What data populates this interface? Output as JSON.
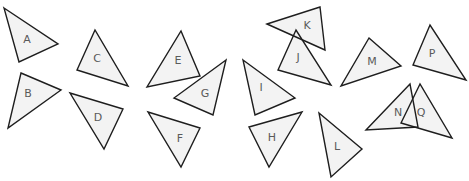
{
  "diagram": {
    "width": 469,
    "height": 181,
    "colors": {
      "background": "#ffffff",
      "fill": "#f3f3f3",
      "stroke": "#1e1e1e",
      "label": "#5a5a5a"
    },
    "triangles": [
      {
        "label": "A",
        "points": [
          [
            4,
            8
          ],
          [
            58,
            44
          ],
          [
            19,
            62
          ]
        ],
        "label_pos": [
          27,
          40
        ]
      },
      {
        "label": "B",
        "points": [
          [
            21,
            73
          ],
          [
            61,
            90
          ],
          [
            8,
            128
          ]
        ],
        "label_pos": [
          28,
          94
        ]
      },
      {
        "label": "C",
        "points": [
          [
            95,
            30
          ],
          [
            77,
            70
          ],
          [
            128,
            86
          ]
        ],
        "label_pos": [
          97,
          59
        ]
      },
      {
        "label": "D",
        "points": [
          [
            70,
            93
          ],
          [
            123,
            109
          ],
          [
            104,
            149
          ]
        ],
        "label_pos": [
          98,
          118
        ]
      },
      {
        "label": "E",
        "points": [
          [
            181,
            31
          ],
          [
            200,
            76
          ],
          [
            147,
            87
          ]
        ],
        "label_pos": [
          178,
          61
        ]
      },
      {
        "label": "F",
        "points": [
          [
            148,
            112
          ],
          [
            200,
            128
          ],
          [
            181,
            167
          ]
        ],
        "label_pos": [
          180,
          139
        ]
      },
      {
        "label": "G",
        "points": [
          [
            226,
            60
          ],
          [
            174,
            98
          ],
          [
            213,
            115
          ]
        ],
        "label_pos": [
          205,
          94
        ]
      },
      {
        "label": "H",
        "points": [
          [
            249,
            127
          ],
          [
            302,
            112
          ],
          [
            269,
            167
          ]
        ],
        "label_pos": [
          272,
          138
        ]
      },
      {
        "label": "I",
        "points": [
          [
            243,
            60
          ],
          [
            295,
            98
          ],
          [
            255,
            115
          ]
        ],
        "label_pos": [
          261,
          88
        ]
      },
      {
        "label": "J",
        "points": [
          [
            296,
            30
          ],
          [
            278,
            70
          ],
          [
            331,
            85
          ]
        ],
        "label_pos": [
          298,
          58
        ]
      },
      {
        "label": "K",
        "points": [
          [
            267,
            24
          ],
          [
            320,
            7
          ],
          [
            325,
            50
          ]
        ],
        "label_pos": [
          307,
          26
        ]
      },
      {
        "label": "L",
        "points": [
          [
            319,
            113
          ],
          [
            362,
            149
          ],
          [
            331,
            177
          ]
        ],
        "label_pos": [
          337,
          147
        ]
      },
      {
        "label": "M",
        "points": [
          [
            369,
            38
          ],
          [
            401,
            66
          ],
          [
            341,
            86
          ]
        ],
        "label_pos": [
          372,
          62
        ]
      },
      {
        "label": "N",
        "points": [
          [
            410,
            84
          ],
          [
            366,
            130
          ],
          [
            418,
            127
          ]
        ],
        "label_pos": [
          398,
          113
        ]
      },
      {
        "label": "P",
        "points": [
          [
            430,
            25
          ],
          [
            413,
            65
          ],
          [
            466,
            80
          ]
        ],
        "label_pos": [
          432,
          54
        ]
      },
      {
        "label": "Q",
        "points": [
          [
            420,
            84
          ],
          [
            401,
            123
          ],
          [
            452,
            138
          ]
        ],
        "label_pos": [
          421,
          113
        ]
      }
    ]
  }
}
